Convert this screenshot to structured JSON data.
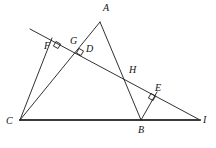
{
  "figure": {
    "canvas": {
      "width": 216,
      "height": 148,
      "background": "#ffffff"
    },
    "style": {
      "stroke_color": "#1a1a1a",
      "baseline_color": "#3a3a3a",
      "thin_width": 0.9,
      "base_width": 2.2,
      "label_color": "#111111",
      "label_font_size": 10
    },
    "points": [
      {
        "id": "A",
        "label": "A",
        "x": 100,
        "y": 22,
        "label_x": 103,
        "label_y": 11
      },
      {
        "id": "B",
        "label": "B",
        "x": 141,
        "y": 120,
        "label_x": 138,
        "label_y": 133
      },
      {
        "id": "C",
        "label": "C",
        "x": 20,
        "y": 120,
        "label_x": 6,
        "label_y": 124
      },
      {
        "id": "D",
        "label": "D",
        "x": 80,
        "y": 51,
        "label_x": 86,
        "label_y": 52
      },
      {
        "id": "E",
        "label": "E",
        "x": 153,
        "y": 96,
        "label_x": 155,
        "label_y": 91
      },
      {
        "id": "F",
        "label": "F",
        "x": 56,
        "y": 45,
        "label_x": 44,
        "label_y": 49
      },
      {
        "id": "G",
        "label": "G",
        "x": 69,
        "y": 47,
        "label_x": 70,
        "label_y": 44
      },
      {
        "id": "H",
        "label": "H",
        "x": 128,
        "y": 76,
        "label_x": 129,
        "label_y": 73
      },
      {
        "id": "I",
        "label": "I",
        "x": 200,
        "y": 120,
        "label_x": 203,
        "label_y": 123
      }
    ],
    "segments": [
      {
        "id": "seg-transversal",
        "from": "line-start",
        "to": "I",
        "x1": 30,
        "y1": 29,
        "x2": 200,
        "y2": 120,
        "kind": "thin"
      },
      {
        "id": "seg-CI",
        "from": "C",
        "to": "I",
        "x1": 20,
        "y1": 120,
        "x2": 200,
        "y2": 120,
        "kind": "base"
      },
      {
        "id": "seg-AC",
        "from": "A",
        "to": "C",
        "x1": 100,
        "y1": 22,
        "x2": 20,
        "y2": 120,
        "kind": "thin"
      },
      {
        "id": "seg-AB",
        "from": "A",
        "to": "B",
        "x1": 100,
        "y1": 22,
        "x2": 141,
        "y2": 120,
        "kind": "thin"
      },
      {
        "id": "seg-CF",
        "from": "C",
        "to": "F",
        "x1": 20,
        "y1": 120,
        "x2": 52,
        "y2": 38,
        "kind": "thin"
      },
      {
        "id": "seg-BE",
        "from": "B",
        "to": "E",
        "x1": 141,
        "y1": 120,
        "x2": 157,
        "y2": 92,
        "kind": "thin"
      }
    ],
    "right_angle_marks": [
      {
        "id": "mark-at-F",
        "x": 57,
        "y": 45,
        "angle_deg": 28
      },
      {
        "id": "mark-at-D",
        "x": 80,
        "y": 52,
        "angle_deg": 28
      },
      {
        "id": "mark-at-E",
        "x": 152,
        "y": 97,
        "angle_deg": 28
      }
    ]
  }
}
